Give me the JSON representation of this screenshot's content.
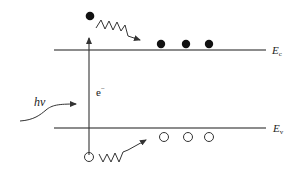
{
  "diagram": {
    "title": "",
    "type": "band-diagram-photoexcitation",
    "colors": {
      "line": "#555555",
      "particle": "#111111",
      "background": "#ffffff"
    },
    "labels": {
      "conduction_band": {
        "main": "E",
        "sub": "c"
      },
      "valence_band": {
        "main": "E",
        "sub": "v"
      },
      "photon": "hν",
      "electron": {
        "main": "e",
        "sup": "−"
      }
    },
    "conduction_band_electrons": 3,
    "valence_band_holes": 3,
    "excited_electron": "filled circle above Ec with wavy relaxation arrow",
    "excited_hole": "open circle below Ev with wavy relaxation arrow"
  }
}
